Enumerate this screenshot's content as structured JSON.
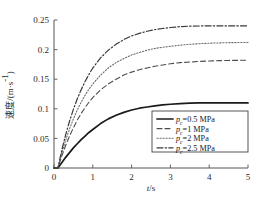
{
  "chart_data": {
    "type": "line",
    "title": "",
    "xlabel": "t/s",
    "ylabel": "速度/(m·s⁻¹)",
    "ylabel_cjk": "速度",
    "ylabel_unit": "/(m·s⁻¹)",
    "xlim": [
      0,
      5
    ],
    "ylim": [
      0,
      0.25
    ],
    "xticks": [
      0,
      1,
      2,
      3,
      4,
      5
    ],
    "xtick_labels": [
      "0",
      "1",
      "2",
      "3",
      "4",
      "5"
    ],
    "yticks": [
      0,
      0.05,
      0.1,
      0.15,
      0.2,
      0.25
    ],
    "ytick_labels": [
      "0",
      "0.05",
      "0.1",
      "0.15",
      "0.2",
      "0.25"
    ],
    "grid": false,
    "legend_position": "lower right",
    "x": [
      0.0,
      0.1,
      0.2,
      0.3,
      0.4,
      0.5,
      0.6,
      0.7,
      0.8,
      0.9,
      1.0,
      1.2,
      1.4,
      1.6,
      1.8,
      2.0,
      2.2,
      2.4,
      2.6,
      2.8,
      3.0,
      3.25,
      3.5,
      3.75,
      4.0,
      4.25,
      4.5,
      4.75,
      5.0
    ],
    "series": [
      {
        "name": "p_c=0.5 MPa",
        "label_var": "p",
        "label_sub": "c",
        "label_rest": "=0.5 MPa",
        "style": "solid",
        "color": "#1a1a1a",
        "width": 1.7,
        "plateau": 0.11,
        "values": [
          0.0,
          0.0,
          0.009,
          0.018,
          0.026,
          0.034,
          0.041,
          0.048,
          0.054,
          0.06,
          0.065,
          0.075,
          0.083,
          0.089,
          0.094,
          0.098,
          0.101,
          0.103,
          0.105,
          0.1065,
          0.1077,
          0.1088,
          0.1095,
          0.1099,
          0.11,
          0.11,
          0.11,
          0.11,
          0.11
        ]
      },
      {
        "name": "p_c=1 MPa",
        "label_var": "p",
        "label_sub": "c",
        "label_rest": "=1 MPa",
        "style": "dashed",
        "color": "#4d4d4d",
        "width": 1.1,
        "plateau": 0.182,
        "values": [
          0.0,
          0.0,
          0.02,
          0.038,
          0.054,
          0.068,
          0.081,
          0.092,
          0.102,
          0.111,
          0.119,
          0.132,
          0.142,
          0.15,
          0.157,
          0.162,
          0.166,
          0.169,
          0.172,
          0.174,
          0.176,
          0.178,
          0.179,
          0.18,
          0.1808,
          0.1813,
          0.1817,
          0.1819,
          0.182
        ]
      },
      {
        "name": "p_c=2 MPa",
        "label_var": "p",
        "label_sub": "c",
        "label_rest": "=2 MPa",
        "style": "dotted",
        "color": "#6b6b6b",
        "width": 1.1,
        "plateau": 0.212,
        "values": [
          0.0,
          0.0,
          0.025,
          0.047,
          0.066,
          0.083,
          0.098,
          0.111,
          0.123,
          0.133,
          0.142,
          0.157,
          0.169,
          0.178,
          0.185,
          0.191,
          0.195,
          0.199,
          0.202,
          0.204,
          0.2055,
          0.2075,
          0.209,
          0.21,
          0.2108,
          0.2113,
          0.2117,
          0.2119,
          0.212
        ]
      },
      {
        "name": "p_c=2.5 MPa",
        "label_var": "p",
        "label_sub": "c",
        "label_rest": "=2.5 MPa",
        "style": "dashdot",
        "color": "#3a3a3a",
        "width": 1.2,
        "plateau": 0.24,
        "values": [
          0.0,
          0.0,
          0.03,
          0.056,
          0.079,
          0.099,
          0.117,
          0.132,
          0.146,
          0.158,
          0.169,
          0.186,
          0.199,
          0.209,
          0.217,
          0.223,
          0.2275,
          0.231,
          0.2337,
          0.2357,
          0.2373,
          0.2388,
          0.2396,
          0.2399,
          0.24,
          0.24,
          0.24,
          0.24,
          0.24
        ]
      }
    ]
  },
  "legend": {
    "entries": [
      {
        "text": "=0.5 MPa"
      },
      {
        "text": "=1 MPa"
      },
      {
        "text": "=2 MPa"
      },
      {
        "text": "=2.5 MPa"
      }
    ],
    "var_symbol": "p",
    "subscript": "c"
  }
}
